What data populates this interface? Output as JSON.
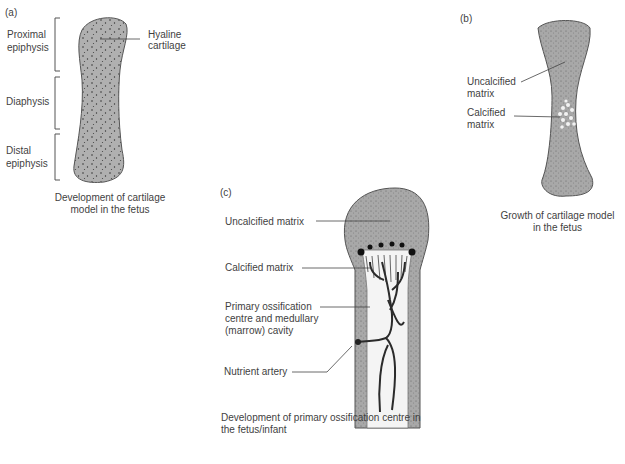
{
  "panel_a": {
    "tag": "(a)",
    "labels": {
      "proximal_1": "Proximal",
      "proximal_2": "epiphysis",
      "diaphysis": "Diaphysis",
      "distal_1": "Distal",
      "distal_2": "epiphysis",
      "hyaline_1": "Hyaline",
      "hyaline_2": "cartilage"
    },
    "caption_1": "Development of cartilage",
    "caption_2": "model in the fetus"
  },
  "panel_b": {
    "tag": "(b)",
    "labels": {
      "uncalcified_1": "Uncalcified",
      "uncalcified_2": "matrix",
      "calcified_1": "Calcified",
      "calcified_2": "matrix"
    },
    "caption_1": "Growth of cartilage model",
    "caption_2": "in the fetus"
  },
  "panel_c": {
    "tag": "(c)",
    "labels": {
      "uncalcified": "Uncalcified matrix",
      "calcified": "Calcified matrix",
      "primary_1": "Primary ossification",
      "primary_2": "centre and medullary",
      "primary_3": "(marrow) cavity",
      "artery": "Nutrient artery"
    },
    "caption_1": "Development of primary ossification centre in",
    "caption_2": "the fetus/infant"
  },
  "colors": {
    "cartilage": "#a9a9a9",
    "cavity": "#f4f4f4",
    "artery": "#2b2b2b",
    "line": "#444444"
  }
}
